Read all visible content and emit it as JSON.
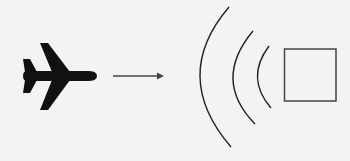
{
  "diagram": {
    "elements": [
      {
        "id": "airplane",
        "icon": "airplane-icon",
        "color": "#111111"
      },
      {
        "id": "motion-arrow",
        "icon": "arrow-right-icon",
        "color": "#444444"
      },
      {
        "id": "wave-arcs",
        "count": 3,
        "color": "#222222"
      },
      {
        "id": "target-square",
        "color": "#444444"
      }
    ],
    "background": "#f3f3f1"
  }
}
